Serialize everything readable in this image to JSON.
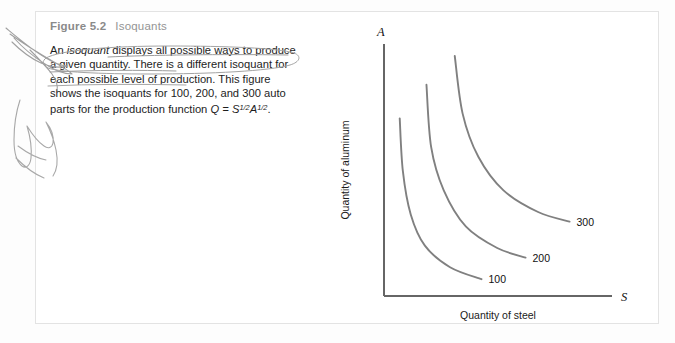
{
  "page": {
    "background_color": "#fdfdfd"
  },
  "panel": {
    "background_color": "#ffffff",
    "border_color": "#e3e3e3"
  },
  "figure": {
    "label": "Figure 5.2",
    "name": "Isoquants",
    "caption_part1": "An ",
    "caption_italic1": "isoquant",
    "caption_part2": " displays all possible ways to produce a given quantity. There is a different isoquant for each possible level of production. This figure shows the isoquants for 100, 200, and 300 auto parts for the production function ",
    "formula_q": "Q",
    "formula_eq": " = ",
    "formula_s": "S",
    "formula_s_exp": "1/2",
    "formula_a": "A",
    "formula_a_exp": "1/2",
    "formula_period": "."
  },
  "annotation": {
    "ink_color": "#9a9a9a",
    "margin_mark": "handwritten-scribble",
    "text_mark": "handwritten-ellipse-underline"
  },
  "chart_data": {
    "type": "line",
    "title": "Isoquants",
    "xlabel": "Quantity of steel",
    "ylabel": "Quantity of aluminum",
    "x_axis_symbol": "S",
    "y_axis_symbol": "A",
    "grid": false,
    "legend_position": "inline-curve-end",
    "curve_color": "#808080",
    "axis_color": "#666666",
    "series": [
      {
        "name": "100",
        "label": "100",
        "output": 100,
        "points": [
          [
            0.1,
            0.74
          ],
          [
            0.12,
            0.52
          ],
          [
            0.17,
            0.34
          ],
          [
            0.26,
            0.21
          ],
          [
            0.42,
            0.12
          ],
          [
            0.62,
            0.07
          ]
        ]
      },
      {
        "name": "200",
        "label": "200",
        "output": 200,
        "points": [
          [
            0.27,
            0.88
          ],
          [
            0.3,
            0.62
          ],
          [
            0.38,
            0.44
          ],
          [
            0.52,
            0.29
          ],
          [
            0.72,
            0.2
          ],
          [
            0.9,
            0.16
          ]
        ]
      },
      {
        "name": "300",
        "label": "300",
        "output": 300,
        "points": [
          [
            0.45,
            1.0
          ],
          [
            0.5,
            0.76
          ],
          [
            0.6,
            0.58
          ],
          [
            0.76,
            0.44
          ],
          [
            0.98,
            0.35
          ],
          [
            1.18,
            0.31
          ]
        ]
      }
    ],
    "function": "Q = S^(1/2) A^(1/2)",
    "xlim": [
      0,
      1.45
    ],
    "ylim": [
      0,
      1.05
    ]
  }
}
